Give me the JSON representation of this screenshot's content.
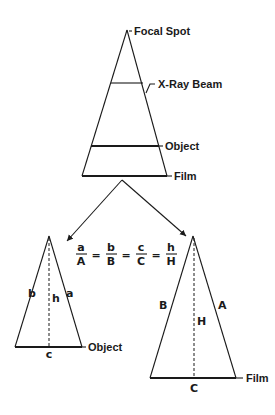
{
  "diagram": {
    "top": {
      "labels": {
        "focal_spot": "Focal Spot",
        "xray_beam": "X-Ray Beam",
        "object": "Object",
        "film": "Film"
      }
    },
    "equation": {
      "fractions": [
        {
          "num": "a",
          "den": "A"
        },
        {
          "num": "b",
          "den": "B"
        },
        {
          "num": "c",
          "den": "C"
        },
        {
          "num": "h",
          "den": "H"
        }
      ],
      "equals": "="
    },
    "small_triangle": {
      "sides": {
        "left": "b",
        "right": "a",
        "height": "h",
        "base": "c"
      },
      "label": "Object"
    },
    "large_triangle": {
      "sides": {
        "left": "B",
        "right": "A",
        "height": "H",
        "base": "C"
      },
      "label": "Film"
    }
  }
}
